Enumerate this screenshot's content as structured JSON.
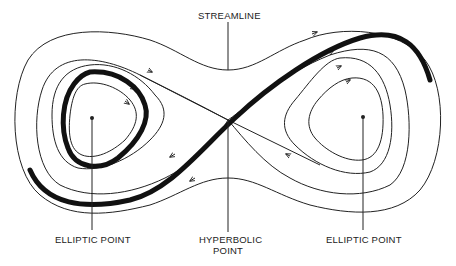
{
  "diagram": {
    "labels": {
      "streamline": "STREAMLINE",
      "elliptic_left": "ELLIPTIC POINT",
      "hyperbolic_line1": "HYPERBOLIC",
      "hyperbolic_line2": "POINT",
      "elliptic_right": "ELLIPTIC POINT"
    },
    "colors": {
      "stroke": "#222222",
      "background": "#ffffff"
    }
  }
}
